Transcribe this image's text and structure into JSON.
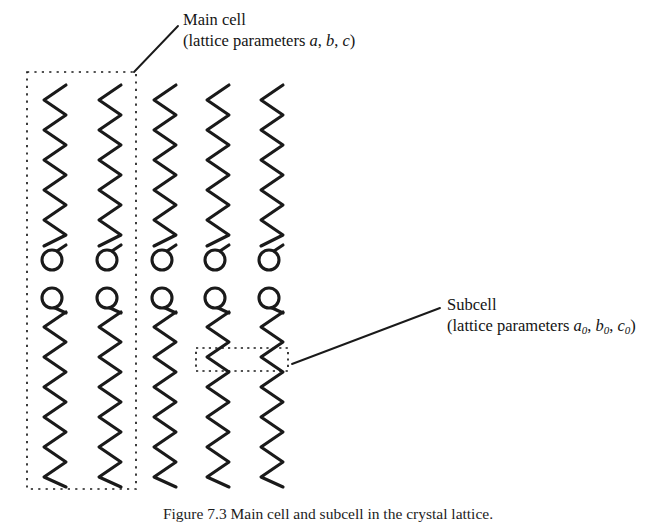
{
  "figure": {
    "background_color": "#ffffff",
    "stroke_color": "#1a1a1a",
    "caption": "Figure 7.3 Main cell and subcell in the crystal lattice."
  },
  "annotations": {
    "main_cell": {
      "line1": "Main cell",
      "line2_prefix": "(lattice parameters ",
      "params": [
        "a",
        "b",
        "c"
      ],
      "separator": ", ",
      "line2_suffix": ")"
    },
    "subcell": {
      "line1": "Subcell",
      "line2_prefix": "(lattice parameters ",
      "params": [
        {
          "base": "a",
          "sub": "0"
        },
        {
          "base": "b",
          "sub": "0"
        },
        {
          "base": "c",
          "sub": "0"
        }
      ],
      "separator": ", ",
      "line2_suffix": ")"
    }
  },
  "diagram": {
    "chain_columns_x": [
      55,
      110,
      165,
      218,
      272
    ],
    "chain_top_y": 85,
    "chain_bottom_y": 487,
    "zigzag_half_width": 11,
    "zigzag_period": 30,
    "headgroup_radius": 10,
    "headgroup_upper_row_y": 260,
    "headgroup_lower_row_y": 298,
    "main_cell_box": {
      "x": 27,
      "y": 72,
      "width": 109,
      "height": 417,
      "style": "dotted"
    },
    "subcell_box": {
      "x": 196,
      "y": 348,
      "width": 92,
      "height": 23,
      "style": "dashed"
    },
    "main_cell_leader": {
      "x1": 134,
      "y1": 72,
      "x2": 178,
      "y2": 26
    },
    "subcell_leader": {
      "x1": 292,
      "y1": 364,
      "x2": 440,
      "y2": 308
    }
  }
}
